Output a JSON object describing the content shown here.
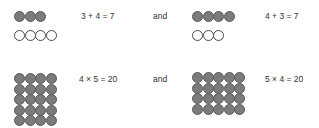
{
  "rows": [
    {
      "left": {
        "groups": [
          {
            "type": "filled",
            "count": 3,
            "cols": 3
          },
          {
            "type": "empty",
            "count": 4,
            "cols": 4
          }
        ],
        "equation": "3 + 4 = 7"
      },
      "connector": "and",
      "right": {
        "groups": [
          {
            "type": "filled",
            "count": 4,
            "cols": 4
          },
          {
            "type": "empty",
            "count": 3,
            "cols": 3
          }
        ],
        "equation": "4 + 3 = 7"
      }
    },
    {
      "left": {
        "groups": [
          {
            "type": "filled",
            "count": 20,
            "cols": 4
          }
        ],
        "equation": "4 × 5 = 20"
      },
      "connector": "and",
      "right": {
        "groups": [
          {
            "type": "filled",
            "count": 20,
            "cols": 5
          }
        ],
        "equation": "5 × 4 = 20"
      }
    }
  ],
  "colors": {
    "filled": "#7b7b7b",
    "outline": "#4a4a4a",
    "text": "#333333"
  }
}
